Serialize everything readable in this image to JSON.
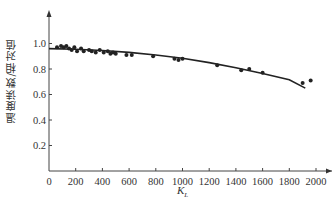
{
  "chart_data": {
    "type": "scatter",
    "title": "",
    "xlabel": "K_L",
    "ylabel": "温度读数/相对值",
    "xlim": [
      0,
      2150
    ],
    "ylim": [
      0,
      1.15
    ],
    "x_ticks": [
      0,
      200,
      400,
      600,
      800,
      1000,
      1200,
      1400,
      1600,
      1800,
      2000
    ],
    "y_ticks": [
      0.2,
      0.4,
      0.6,
      0.8,
      1.0
    ],
    "grid": false,
    "legend": null,
    "series": [
      {
        "name": "measured",
        "type": "scatter",
        "points": [
          [
            60,
            0.97
          ],
          [
            90,
            0.98
          ],
          [
            110,
            0.97
          ],
          [
            130,
            0.98
          ],
          [
            150,
            0.96
          ],
          [
            170,
            0.95
          ],
          [
            190,
            0.97
          ],
          [
            210,
            0.94
          ],
          [
            240,
            0.96
          ],
          [
            260,
            0.94
          ],
          [
            300,
            0.95
          ],
          [
            320,
            0.94
          ],
          [
            350,
            0.93
          ],
          [
            380,
            0.95
          ],
          [
            410,
            0.93
          ],
          [
            440,
            0.94
          ],
          [
            460,
            0.92
          ],
          [
            480,
            0.93
          ],
          [
            500,
            0.92
          ],
          [
            580,
            0.91
          ],
          [
            620,
            0.91
          ],
          [
            780,
            0.9
          ],
          [
            940,
            0.88
          ],
          [
            970,
            0.87
          ],
          [
            1000,
            0.88
          ],
          [
            1260,
            0.83
          ],
          [
            1440,
            0.79
          ],
          [
            1500,
            0.8
          ],
          [
            1600,
            0.77
          ],
          [
            1900,
            0.69
          ],
          [
            1960,
            0.71
          ]
        ]
      },
      {
        "name": "fit",
        "type": "line",
        "points": [
          [
            0,
            0.96
          ],
          [
            200,
            0.955
          ],
          [
            400,
            0.945
          ],
          [
            600,
            0.93
          ],
          [
            800,
            0.91
          ],
          [
            1000,
            0.885
          ],
          [
            1200,
            0.85
          ],
          [
            1400,
            0.81
          ],
          [
            1600,
            0.765
          ],
          [
            1800,
            0.715
          ],
          [
            1920,
            0.65
          ]
        ]
      }
    ]
  },
  "labels": {
    "ylabel": "温度读数/相对值",
    "xlabel_main": "K",
    "xlabel_sub": "L"
  }
}
